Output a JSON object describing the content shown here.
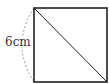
{
  "diagram": {
    "shape": "square",
    "side_label": "6cm",
    "has_diagonal": true,
    "diagonal": "top-left to bottom-right",
    "dimension_marker": "dashed arc along left side",
    "colors": {
      "stroke": "#222222",
      "dashed_arc": "#999999",
      "label": "#333333"
    }
  }
}
